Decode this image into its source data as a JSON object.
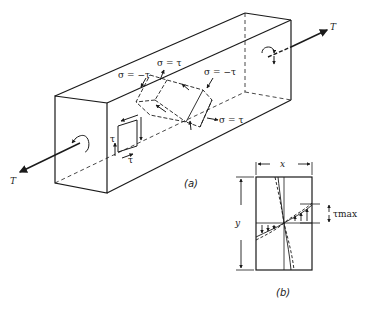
{
  "figure": {
    "panel_a": {
      "caption": "(a)",
      "torque_label_right": "T",
      "torque_label_left": "T",
      "stress_labels": {
        "top_left": "σ = −τ",
        "top_middle": "σ = τ",
        "top_right": "σ = −τ",
        "bottom_right": "σ = τ"
      },
      "element_labels": {
        "vertical_shear": "τ",
        "horizontal_shear": "τ"
      }
    },
    "panel_b": {
      "caption": "(b)",
      "width_label": "x",
      "height_label": "y",
      "max_shear_label": "τmax"
    }
  },
  "colors": {
    "ink": "#1a1a1a",
    "background": "#ffffff"
  }
}
